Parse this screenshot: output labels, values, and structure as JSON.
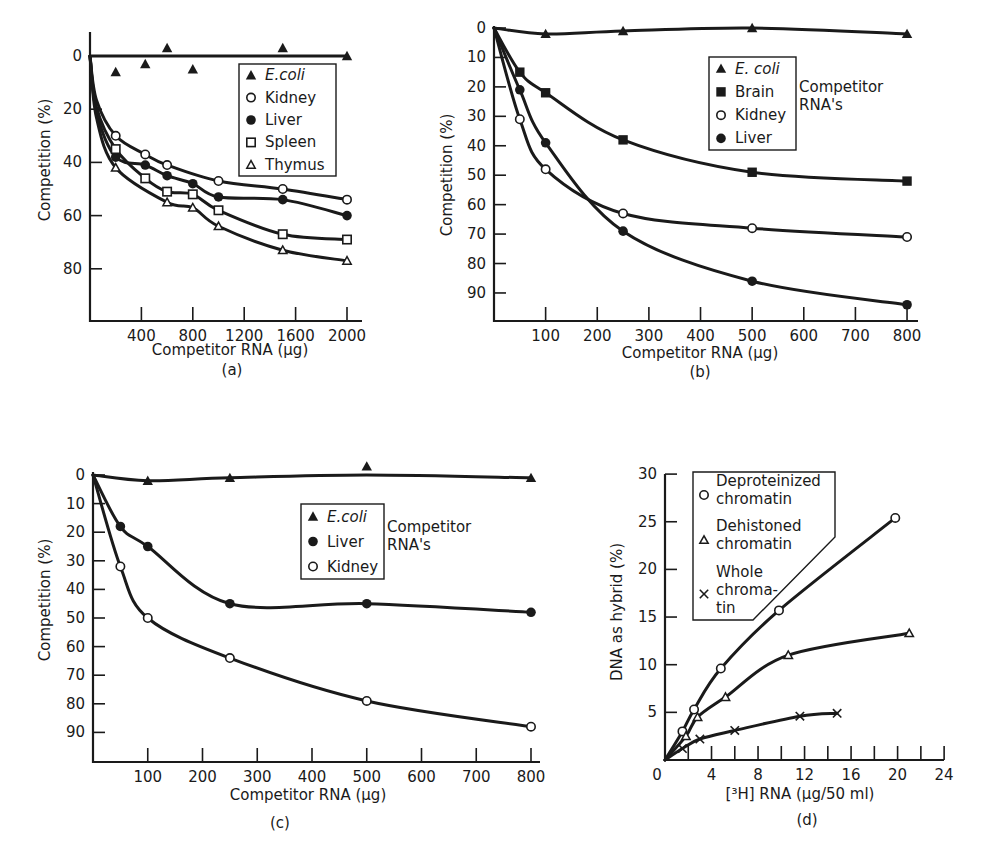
{
  "figure": {
    "panels": [
      "(a)",
      "(b)",
      "(c)",
      "(d)"
    ]
  },
  "chart_data": [
    {
      "panel": "(a)",
      "type": "scatter",
      "title": "",
      "xlabel": "Competitor RNA (μg)",
      "ylabel": "Competition (%)",
      "xlim": [
        0,
        2100
      ],
      "ylim": [
        0,
        100
      ],
      "y_inverted": true,
      "xticks": [
        400,
        800,
        1200,
        1600,
        2000
      ],
      "xtick_labels": [
        "400",
        "800",
        "1200",
        "1600",
        "2000"
      ],
      "yticks": [
        0,
        20,
        40,
        60,
        80
      ],
      "ytick_labels": [
        "0",
        "20",
        "40",
        "60",
        "80"
      ],
      "grid": false,
      "legend_position": "upper right",
      "series": [
        {
          "name": "E. coli",
          "marker": "triangle-filled",
          "x": [
            200,
            430,
            600,
            800,
            1500,
            2000
          ],
          "y": [
            6,
            3,
            -3,
            5,
            -3,
            0
          ],
          "fit": "flat"
        },
        {
          "name": "Kidney",
          "marker": "circle-open",
          "x": [
            200,
            430,
            600,
            1000,
            1500,
            2000
          ],
          "y": [
            30,
            37,
            41,
            47,
            50,
            54
          ]
        },
        {
          "name": "Liver",
          "marker": "circle-filled",
          "x": [
            200,
            430,
            600,
            800,
            1000,
            1500,
            2000
          ],
          "y": [
            38,
            41,
            45,
            48,
            53,
            54,
            60
          ]
        },
        {
          "name": "Spleen",
          "marker": "square-open",
          "x": [
            200,
            430,
            600,
            800,
            1000,
            1500,
            2000
          ],
          "y": [
            35,
            46,
            51,
            52,
            58,
            67,
            69
          ]
        },
        {
          "name": "Thymus",
          "marker": "triangle-open",
          "x": [
            200,
            600,
            800,
            1000,
            1500,
            2000
          ],
          "y": [
            42,
            55,
            57,
            64,
            73,
            77
          ]
        }
      ]
    },
    {
      "panel": "(b)",
      "type": "line",
      "title": "",
      "xlabel": "Competitor RNA (μg)",
      "ylabel": "Competition (%)",
      "xlim": [
        0,
        820
      ],
      "ylim": [
        0,
        100
      ],
      "y_inverted": true,
      "xticks": [
        100,
        200,
        300,
        400,
        500,
        600,
        700,
        800
      ],
      "xtick_labels": [
        "100",
        "200",
        "300",
        "400",
        "500",
        "600",
        "700",
        "800"
      ],
      "yticks": [
        0,
        10,
        20,
        30,
        40,
        50,
        60,
        70,
        80,
        90
      ],
      "ytick_labels": [
        "0",
        "10",
        "20",
        "30",
        "40",
        "50",
        "60",
        "70",
        "80",
        "90"
      ],
      "grid": false,
      "legend_position": "upper center",
      "legend_note": [
        "Competitor",
        "RNA's"
      ],
      "series": [
        {
          "name": "E. coli",
          "marker": "triangle-filled",
          "x": [
            100,
            250,
            500,
            800
          ],
          "y": [
            2,
            1,
            0,
            2
          ]
        },
        {
          "name": "Brain",
          "marker": "square-filled",
          "x": [
            50,
            100,
            250,
            500,
            800
          ],
          "y": [
            15,
            22,
            38,
            49,
            52
          ]
        },
        {
          "name": "Kidney",
          "marker": "circle-open",
          "x": [
            50,
            100,
            250,
            500,
            800
          ],
          "y": [
            31,
            48,
            63,
            68,
            71
          ]
        },
        {
          "name": "Liver",
          "marker": "circle-filled",
          "x": [
            50,
            100,
            250,
            500,
            800
          ],
          "y": [
            21,
            39,
            69,
            86,
            94
          ]
        }
      ]
    },
    {
      "panel": "(c)",
      "type": "line",
      "title": "",
      "xlabel": "Competitor RNA (μg)",
      "ylabel": "Competition (%)",
      "xlim": [
        0,
        820
      ],
      "ylim": [
        0,
        100
      ],
      "y_inverted": true,
      "xticks": [
        100,
        200,
        300,
        400,
        500,
        600,
        700,
        800
      ],
      "xtick_labels": [
        "100",
        "200",
        "300",
        "400",
        "500",
        "600",
        "700",
        "800"
      ],
      "yticks": [
        0,
        10,
        20,
        30,
        40,
        50,
        60,
        70,
        80,
        90
      ],
      "ytick_labels": [
        "0",
        "10",
        "20",
        "30",
        "40",
        "50",
        "60",
        "70",
        "80",
        "90"
      ],
      "grid": false,
      "legend_position": "upper center",
      "legend_note": [
        "Competitor",
        "RNA's"
      ],
      "series": [
        {
          "name": "E. coli",
          "marker": "triangle-filled",
          "x": [
            100,
            250,
            500,
            800
          ],
          "y": [
            2,
            1,
            -3,
            1
          ]
        },
        {
          "name": "Liver",
          "marker": "circle-filled",
          "x": [
            50,
            100,
            250,
            500,
            800
          ],
          "y": [
            18,
            25,
            45,
            45,
            48
          ]
        },
        {
          "name": "Kidney",
          "marker": "circle-open",
          "x": [
            50,
            100,
            250,
            500,
            800
          ],
          "y": [
            32,
            50,
            64,
            79,
            88
          ]
        }
      ]
    },
    {
      "panel": "(d)",
      "type": "line",
      "title": "",
      "xlabel": "[³H] RNA (μg/50 ml)",
      "ylabel": "DNA as hybrid (%)",
      "xlim": [
        0,
        24
      ],
      "ylim": [
        0,
        30
      ],
      "y_inverted": false,
      "xticks": [
        0,
        4,
        8,
        12,
        16,
        20,
        24
      ],
      "xtick_labels": [
        "0",
        "4",
        "8",
        "12",
        "16",
        "20",
        "24"
      ],
      "yticks": [
        5,
        10,
        15,
        20,
        25,
        30
      ],
      "ytick_labels": [
        "5",
        "10",
        "15",
        "20",
        "25",
        "30"
      ],
      "grid": false,
      "legend_position": "upper left",
      "series": [
        {
          "name": "Deproteinized chromatin",
          "marker": "circle-open",
          "x": [
            1.5,
            2.5,
            4.8,
            9.8,
            19.8
          ],
          "y": [
            3.0,
            5.3,
            9.6,
            15.7,
            25.4
          ]
        },
        {
          "name": "Dehistoned chromatin",
          "marker": "triangle-open",
          "x": [
            1.8,
            2.8,
            5.2,
            10.6,
            21.0
          ],
          "y": [
            2.5,
            4.5,
            6.6,
            11.0,
            13.3
          ]
        },
        {
          "name": "Whole chromatin",
          "marker": "x",
          "x": [
            1.5,
            3.0,
            6.0,
            11.6,
            14.8
          ],
          "y": [
            1.2,
            2.2,
            3.1,
            4.6,
            4.9
          ]
        }
      ]
    }
  ],
  "labels": {
    "a": {
      "xlabel": "Competitor RNA (μg)",
      "ylabel": "Competition (%)",
      "panel": "(a)",
      "legend": [
        "E.coli",
        "Kidney",
        "Liver",
        "Spleen",
        "Thymus"
      ]
    },
    "b": {
      "xlabel": "Competitor RNA (μg)",
      "ylabel": "Competition (%)",
      "panel": "(b)",
      "legend": [
        "E. coli",
        "Brain",
        "Kidney",
        "Liver"
      ],
      "note1": "Competitor",
      "note2": "RNA's"
    },
    "c": {
      "xlabel": "Competitor RNA (μg)",
      "ylabel": "Competition (%)",
      "panel": "(c)",
      "legend": [
        "E.coli",
        "Liver",
        "Kidney"
      ],
      "note1": "Competitor",
      "note2": "RNA's"
    },
    "d": {
      "xlabel": "[³H] RNA (μg/50 ml)",
      "ylabel": "DNA as hybrid (%)",
      "panel": "(d)",
      "legend": [
        [
          "Deproteinized",
          "chromatin"
        ],
        [
          "Dehistoned",
          "chromatin"
        ],
        [
          "Whole",
          "chroma-",
          "tin"
        ]
      ]
    }
  }
}
